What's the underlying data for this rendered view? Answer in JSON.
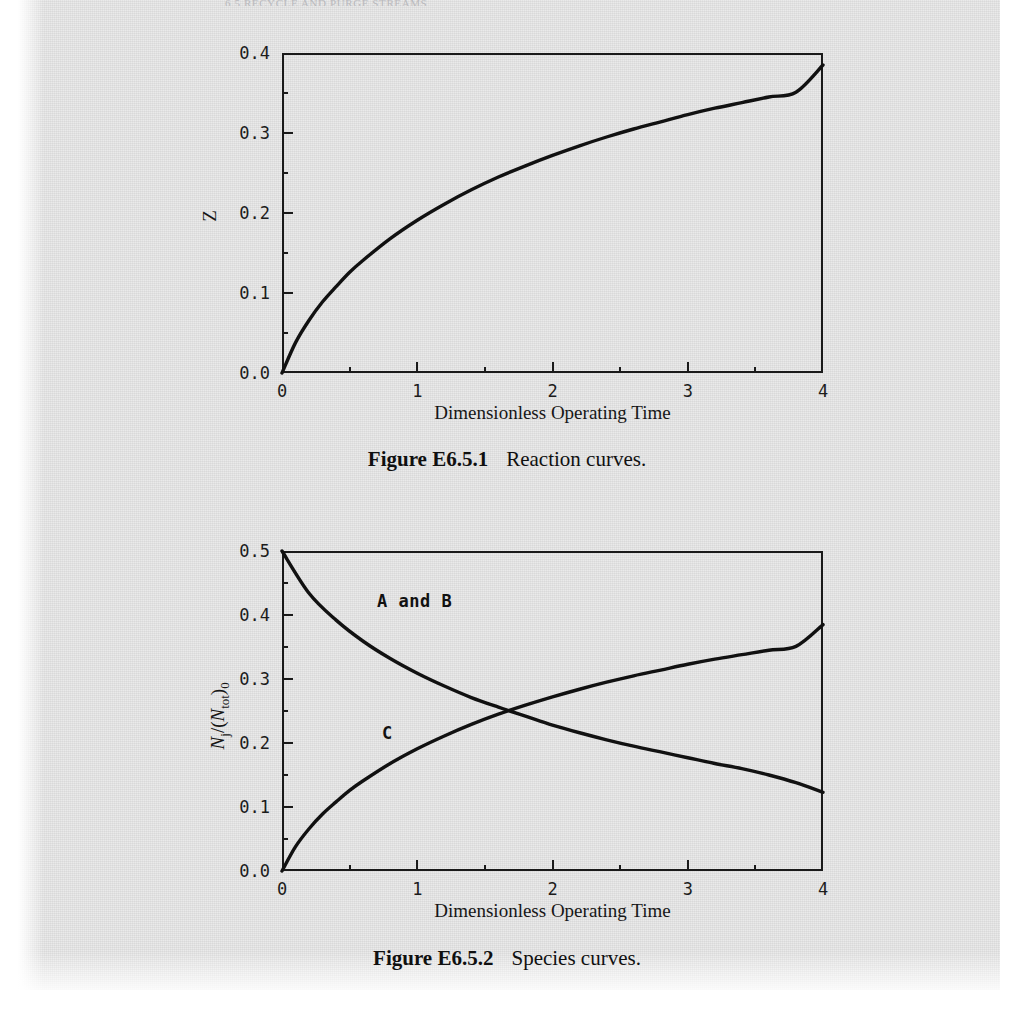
{
  "page": {
    "running_head": "6.5   RECYCLE AND PURGE STREAMS",
    "background_color": "#e8e8e8",
    "ink_color": "#111111"
  },
  "figures": [
    {
      "id": "figure-1",
      "caption_label": "Figure E6.5.1",
      "caption_text": "Reaction curves.",
      "chart_data": {
        "type": "line",
        "title": "",
        "xlabel": "Dimensionless Operating Time",
        "ylabel": "Z",
        "xlim": [
          0,
          4
        ],
        "ylim": [
          0,
          0.4
        ],
        "xticks": [
          "0",
          "1",
          "2",
          "3",
          "4"
        ],
        "xtick_values": [
          0,
          1,
          2,
          3,
          4
        ],
        "yticks": [
          "0.0",
          "0.1",
          "0.2",
          "0.3",
          "0.4"
        ],
        "ytick_values": [
          0.0,
          0.1,
          0.2,
          0.3,
          0.4
        ],
        "minor_tick_step_x": 0.5,
        "minor_tick_step_y": 0.05,
        "grid": false,
        "legend": "none",
        "series": [
          {
            "name": "Z",
            "x": [
              0,
              0.1,
              0.2,
              0.3,
              0.4,
              0.5,
              0.6,
              0.8,
              1.0,
              1.2,
              1.4,
              1.6,
              1.8,
              2.0,
              2.2,
              2.4,
              2.6,
              2.8,
              3.0,
              3.2,
              3.4,
              3.6,
              3.8,
              4.0
            ],
            "values": [
              0.0,
              0.038,
              0.066,
              0.089,
              0.108,
              0.126,
              0.141,
              0.168,
              0.191,
              0.211,
              0.229,
              0.245,
              0.259,
              0.272,
              0.284,
              0.295,
              0.305,
              0.314,
              0.323,
              0.331,
              0.338,
              0.345,
              0.351,
              0.385
            ]
          }
        ]
      }
    },
    {
      "id": "figure-2",
      "caption_label": "Figure E6.5.2",
      "caption_text": "Species curves.",
      "annotations": [
        {
          "name": "annotation-a-and-b",
          "text": "A and B"
        },
        {
          "name": "annotation-c",
          "text": "C"
        }
      ],
      "chart_data": {
        "type": "line",
        "title": "",
        "xlabel": "Dimensionless Operating Time",
        "ylabel": "Nj/(Ntot)0",
        "ylabel_parts": {
          "numerator": "N",
          "numerator_sub": "j",
          "denominator": "N",
          "denominator_sub": "tot",
          "outer_sub": "0"
        },
        "xlim": [
          0,
          4
        ],
        "ylim": [
          0,
          0.5
        ],
        "xticks": [
          "0",
          "1",
          "2",
          "3",
          "4"
        ],
        "xtick_values": [
          0,
          1,
          2,
          3,
          4
        ],
        "yticks": [
          "0.0",
          "0.1",
          "0.2",
          "0.3",
          "0.4",
          "0.5"
        ],
        "ytick_values": [
          0.0,
          0.1,
          0.2,
          0.3,
          0.4,
          0.5
        ],
        "minor_tick_step_x": 0.5,
        "minor_tick_step_y": 0.05,
        "grid": false,
        "legend": "inline-annotations",
        "crossing_point": [
          1.67,
          0.255
        ],
        "series": [
          {
            "name": "A and B",
            "x": [
              0,
              0.2,
              0.4,
              0.6,
              0.8,
              1.0,
              1.2,
              1.4,
              1.6,
              1.8,
              2.0,
              2.2,
              2.4,
              2.6,
              2.8,
              3.0,
              3.2,
              3.4,
              3.6,
              3.8,
              4.0
            ],
            "values": [
              0.5,
              0.434,
              0.392,
              0.359,
              0.332,
              0.309,
              0.289,
              0.271,
              0.256,
              0.242,
              0.228,
              0.216,
              0.205,
              0.195,
              0.186,
              0.177,
              0.168,
              0.16,
              0.15,
              0.138,
              0.123
            ]
          },
          {
            "name": "C",
            "x": [
              0,
              0.1,
              0.2,
              0.3,
              0.4,
              0.5,
              0.6,
              0.8,
              1.0,
              1.2,
              1.4,
              1.6,
              1.8,
              2.0,
              2.2,
              2.4,
              2.6,
              2.8,
              3.0,
              3.2,
              3.4,
              3.6,
              3.8,
              4.0
            ],
            "values": [
              0.0,
              0.038,
              0.066,
              0.089,
              0.108,
              0.126,
              0.141,
              0.168,
              0.191,
              0.211,
              0.229,
              0.245,
              0.259,
              0.272,
              0.284,
              0.295,
              0.305,
              0.314,
              0.323,
              0.331,
              0.338,
              0.345,
              0.351,
              0.385
            ]
          }
        ]
      }
    }
  ]
}
